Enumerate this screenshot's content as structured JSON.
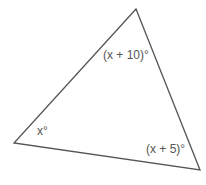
{
  "diagram": {
    "type": "triangle",
    "vertices": {
      "top": [
        136,
        9
      ],
      "left": [
        14,
        143
      ],
      "bottom_right": [
        200,
        170
      ]
    },
    "stroke_color": "#555555",
    "angles": {
      "top": "(x + 10)°",
      "left": "x°",
      "bottom_right": "(x + 5)°"
    }
  }
}
